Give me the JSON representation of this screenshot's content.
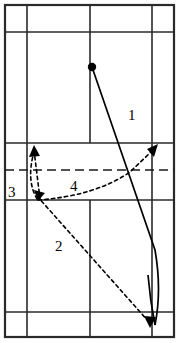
{
  "figure": {
    "name": "badminton-court-shot-diagram",
    "width": 180,
    "height": 343,
    "background_color": "#ffffff",
    "line_color": "#2a2a2a",
    "trajectory_color": "#000000"
  },
  "court": {
    "description": "Badminton court viewed from above, portrait orientation",
    "outer_boundary": {
      "x": 5,
      "y": 5,
      "width": 169,
      "height": 332
    },
    "vertical_lines": [
      5,
      27,
      90,
      152,
      174
    ],
    "horizontal_lines": [
      5,
      32,
      143,
      200,
      312,
      337
    ],
    "net_line_y": 170,
    "net_line_style": "dashed"
  },
  "start_point": {
    "label": "serve-origin",
    "x": 92,
    "y": 67,
    "radius": 4.2
  },
  "shots": [
    {
      "id": "1",
      "label": "1",
      "style": "solid",
      "label_x": 128,
      "label_y": 120,
      "has_arrow": false,
      "description": "Solid line from origin curving down to bottom right corner"
    },
    {
      "id": "2",
      "label": "2",
      "style": "dashed",
      "label_x": 55,
      "label_y": 251,
      "has_arrow": true,
      "arrow_x": 150,
      "arrow_y": 325,
      "description": "Dashed line from left mid court down to bottom right"
    },
    {
      "id": "3",
      "label": "3",
      "style": "dashed",
      "label_x": 8,
      "label_y": 197,
      "has_arrow": true,
      "arrow_x": 35,
      "arrow_y": 147,
      "description": "Short dashed lift from left service area upward"
    },
    {
      "id": "4",
      "label": "4",
      "style": "dashed",
      "label_x": 70,
      "label_y": 191,
      "has_arrow": true,
      "arrow_x": 157,
      "arrow_y": 146,
      "description": "Dashed curve rising from left service area across to right"
    }
  ]
}
